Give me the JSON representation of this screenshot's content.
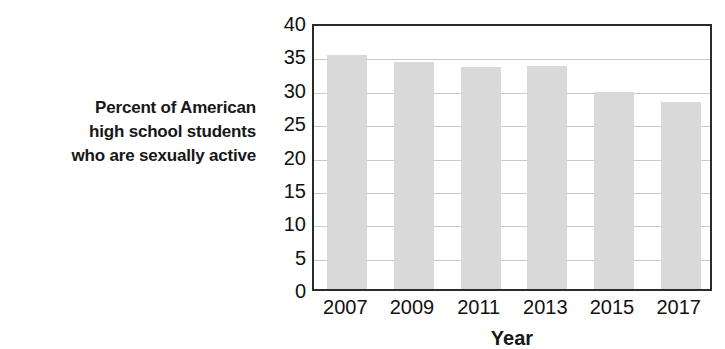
{
  "chart_data": {
    "type": "bar",
    "title": "",
    "subtitle": "",
    "categories": [
      "2007",
      "2009",
      "2011",
      "2013",
      "2015",
      "2017"
    ],
    "values": [
      35.0,
      34.0,
      33.3,
      33.4,
      29.5,
      28.0
    ],
    "xlabel": "Year",
    "ylabel_lines": [
      "Percent of American",
      "high school students",
      "who are sexually active"
    ],
    "ylabel": "Percent of American high school students who are sexually active",
    "ylim": [
      0,
      40
    ],
    "ytick_step": 5,
    "ytick_labels": [
      "40",
      "35",
      "30",
      "25",
      "20",
      "15",
      "10",
      "5",
      "0"
    ],
    "ytick_values": [
      40,
      35,
      30,
      25,
      20,
      15,
      10,
      5,
      0
    ],
    "xtick_labels": [
      "2007",
      "2009",
      "2011",
      "2013",
      "2015",
      "2017"
    ],
    "grid": "horizontal",
    "legend": "none",
    "legend_position": "none",
    "annotations": [],
    "colors": {
      "bar_fill": "#d9d9d9",
      "axis_line": "#2b2b2b",
      "gridline": "#c9c9c9",
      "text": "#111111"
    }
  }
}
